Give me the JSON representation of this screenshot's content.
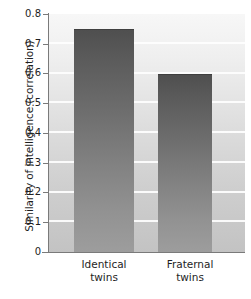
{
  "chart_data": {
    "type": "bar",
    "title": "",
    "xlabel": "",
    "ylabel": "Similarity of intelligence (correlation)",
    "categories": [
      "Identical twins",
      "Fraternal twins"
    ],
    "category_lines": [
      [
        "Identical",
        "twins"
      ],
      [
        "Fraternal",
        "twins"
      ]
    ],
    "values": [
      0.75,
      0.6
    ],
    "ylim": [
      0,
      0.8
    ],
    "ytick_labels": [
      "0.8",
      "0.7",
      "0.6",
      "0.5",
      "0.4",
      "0.3",
      "0.2",
      "0.1",
      "0"
    ],
    "ytick_values": [
      0.8,
      0.7,
      0.6,
      0.5,
      0.4,
      0.3,
      0.2,
      0.1,
      0
    ],
    "grid": true,
    "gridline_color": "#fdfdfd",
    "legend": null,
    "bar_gradient_top_color": "#4f4f4f",
    "bar_gradient_bottom_color": "#9d9d9d",
    "plot_background_top_color": "#f7f7f7",
    "plot_background_bottom_color": "#c3c3c3",
    "axis_color": "#7a7a7a",
    "text_color": "#1e1e1e"
  }
}
